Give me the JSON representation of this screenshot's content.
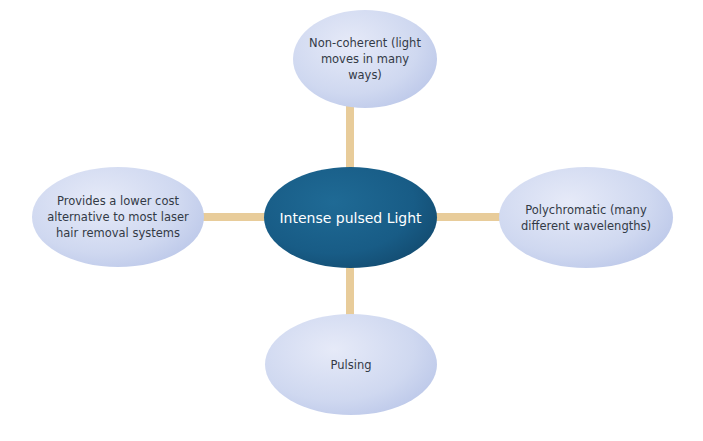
{
  "diagram": {
    "type": "mind-map",
    "center": {
      "label": "Intense pulsed Light"
    },
    "nodes": {
      "top": {
        "label": "Non-coherent (light moves in many ways)"
      },
      "left": {
        "label": "Provides a lower cost alternative to most laser hair removal systems"
      },
      "right": {
        "label": "Polychromatic (many different wavelengths)"
      },
      "bottom": {
        "label": "Pulsing"
      }
    },
    "colors": {
      "center_fill": "#185c86",
      "outer_fill": "#cfd8f0",
      "connector": "#e8cc9a"
    }
  }
}
